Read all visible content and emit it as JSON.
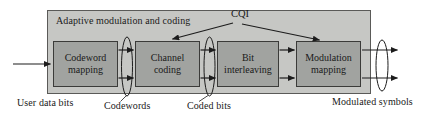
{
  "diagram": {
    "title": "Adaptive modulation and coding",
    "cqi_label": "CQI",
    "blocks": [
      {
        "lines": [
          "Codeword",
          "mapping"
        ]
      },
      {
        "lines": [
          "Channel",
          "coding"
        ]
      },
      {
        "lines": [
          "Bit",
          "interleaving"
        ]
      },
      {
        "lines": [
          "Modulation",
          "mapping"
        ]
      }
    ],
    "flow_labels": {
      "input": "User data bits",
      "codewords": "Codewords",
      "coded_bits": "Coded bits",
      "output": "Modulated symbols"
    },
    "colors": {
      "background": "#ffffff",
      "outer_fill": "#c6c7c4",
      "outer_border": "#5a5a58",
      "block_fill": "#a1a3a0",
      "block_border": "#3b3b39",
      "line": "#1c1c1c",
      "text": "#1a1a1a"
    }
  }
}
